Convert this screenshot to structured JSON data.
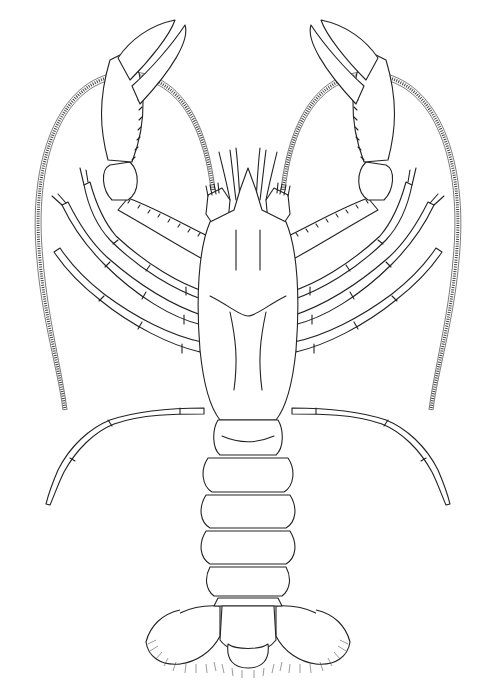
{
  "figure": {
    "subject": "crayfish dorsal view line drawing",
    "style": "black ink scientific illustration on white",
    "background_color": "#ffffff",
    "line_color": "#222222",
    "parts": [
      "antennae",
      "antennules",
      "chelae (claws)",
      "walking legs (4 pairs)",
      "carapace",
      "abdominal segments (6)",
      "telson",
      "uropods with setae"
    ]
  }
}
